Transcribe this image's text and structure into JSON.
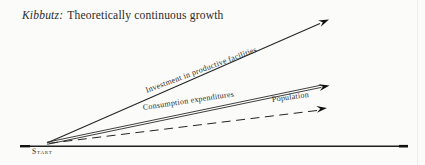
{
  "page": {
    "title": {
      "term": "Kibbutz:",
      "text": "Theoretically continuous growth"
    }
  },
  "diagram": {
    "type": "conceptual-growth-diagram",
    "origin_label": "Start",
    "baseline": "time axis (unlabeled horizontal base line)",
    "lines": [
      {
        "name": "investment",
        "label": "Investment in productive facilities",
        "style": "solid",
        "slope": "steepest",
        "arrow": true
      },
      {
        "name": "consumption",
        "label": "Consumption expenditures",
        "style": "double-solid",
        "slope": "medium",
        "arrow": true
      },
      {
        "name": "population",
        "label": "Population",
        "style": "dashed",
        "slope": "shallowest",
        "arrow": true
      }
    ],
    "colors": {
      "ink": "#1f1f1f",
      "background": "#fbfbf9"
    }
  }
}
